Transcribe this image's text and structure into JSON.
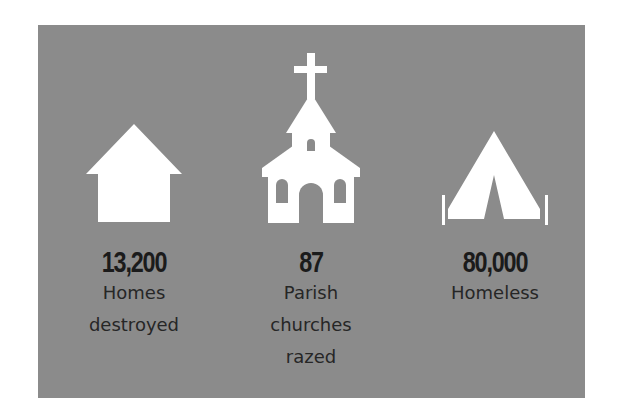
{
  "stats": [
    {
      "icon": "house-icon",
      "value": "13,200",
      "label_lines": [
        "Homes",
        "destroyed"
      ]
    },
    {
      "icon": "church-icon",
      "value": "87",
      "label_lines": [
        "Parish",
        "churches",
        "razed"
      ]
    },
    {
      "icon": "tent-icon",
      "value": "80,000",
      "label_lines": [
        "Homeless"
      ]
    }
  ],
  "colors": {
    "panel": "#8b8b8b",
    "icon": "#ffffff",
    "number": "#1b1b1b",
    "label": "#262626"
  }
}
